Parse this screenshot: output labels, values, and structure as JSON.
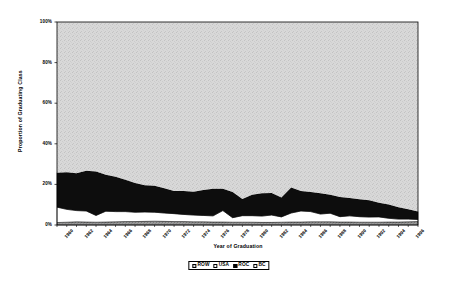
{
  "chart_data": {
    "type": "area",
    "title": "",
    "subtitle": "",
    "xlabel": "Year of Graduation",
    "ylabel": "Proportion of Graduating Class",
    "stacked": true,
    "grid": false,
    "legend_position": "bottom",
    "ylim": [
      0,
      100
    ],
    "ytick_labels": [
      "0%",
      "20%",
      "40%",
      "60%",
      "80%",
      "100%"
    ],
    "ytick_values": [
      0,
      20,
      40,
      60,
      80,
      100
    ],
    "xlim": [
      1960,
      1997
    ],
    "xtick_labels": [
      "1960",
      "1962",
      "1964",
      "1966",
      "1968",
      "1970",
      "1972",
      "1974",
      "1976",
      "1978",
      "1980",
      "1982",
      "1984",
      "1986",
      "1988",
      "1990",
      "1992",
      "1994",
      "1996"
    ],
    "xtick_values": [
      1960,
      1962,
      1964,
      1966,
      1968,
      1970,
      1972,
      1974,
      1976,
      1978,
      1980,
      1982,
      1984,
      1986,
      1988,
      1990,
      1992,
      1994,
      1996
    ],
    "x": [
      1960,
      1961,
      1962,
      1963,
      1964,
      1965,
      1966,
      1967,
      1968,
      1969,
      1970,
      1971,
      1972,
      1973,
      1974,
      1975,
      1976,
      1977,
      1978,
      1979,
      1980,
      1981,
      1982,
      1983,
      1984,
      1985,
      1986,
      1987,
      1988,
      1989,
      1990,
      1991,
      1992,
      1993,
      1994,
      1995,
      1996,
      1997
    ],
    "series": [
      {
        "name": "BC",
        "color": "#8c8c8c",
        "stack_order": 1,
        "values": [
          1.2,
          1.4,
          1.6,
          1.5,
          1.4,
          1.5,
          1.6,
          1.7,
          1.7,
          1.8,
          1.9,
          1.8,
          1.7,
          1.7,
          1.6,
          1.6,
          1.5,
          1.5,
          1.4,
          1.4,
          1.4,
          1.3,
          1.3,
          1.4,
          1.5,
          1.5,
          1.6,
          1.6,
          1.6,
          1.5,
          1.5,
          1.4,
          1.4,
          1.4,
          1.5,
          1.5,
          1.6,
          1.7
        ]
      },
      {
        "name": "USA",
        "color": "#ffffff",
        "stack_order": 2,
        "values": [
          7.6,
          6.3,
          5.5,
          5.4,
          3.3,
          5.3,
          5.0,
          4.9,
          4.6,
          4.6,
          4.4,
          4.1,
          3.9,
          3.5,
          3.3,
          3.1,
          3.0,
          5.6,
          2.2,
          3.2,
          3.2,
          3.1,
          3.6,
          2.6,
          4.4,
          5.4,
          5.0,
          3.8,
          4.2,
          2.6,
          3.0,
          2.7,
          2.5,
          2.6,
          1.8,
          1.4,
          1.3,
          1.0
        ]
      },
      {
        "name": "ROC",
        "color": "#0d0d0d",
        "stack_order": 3,
        "values": [
          17.0,
          18.3,
          18.4,
          19.8,
          21.6,
          18.0,
          17.2,
          15.7,
          14.4,
          13.2,
          13.0,
          12.2,
          11.1,
          11.6,
          11.5,
          12.5,
          13.4,
          10.8,
          12.7,
          8.2,
          10.3,
          11.2,
          10.9,
          9.5,
          12.6,
          9.9,
          9.6,
          10.2,
          9.1,
          9.7,
          8.8,
          8.6,
          8.3,
          7.0,
          6.8,
          5.9,
          4.8,
          3.9
        ]
      },
      {
        "name": "ROW",
        "color": "#d4d4d4",
        "stack_order": 4,
        "values": [
          74.2,
          74.0,
          74.5,
          73.3,
          73.7,
          75.2,
          76.2,
          77.7,
          79.3,
          80.4,
          80.7,
          81.9,
          83.3,
          83.2,
          83.6,
          82.8,
          82.1,
          82.1,
          83.7,
          87.2,
          85.1,
          84.4,
          84.2,
          86.5,
          81.5,
          83.2,
          83.8,
          84.4,
          85.1,
          86.2,
          86.7,
          87.3,
          87.8,
          89.0,
          89.9,
          91.2,
          92.3,
          93.4
        ]
      }
    ],
    "legend_entries": [
      {
        "label": "ROW",
        "swatch": "light-gray"
      },
      {
        "label": "USA",
        "swatch": "white"
      },
      {
        "label": "ROC",
        "swatch": "black"
      },
      {
        "label": "BC",
        "swatch": "white"
      }
    ]
  }
}
